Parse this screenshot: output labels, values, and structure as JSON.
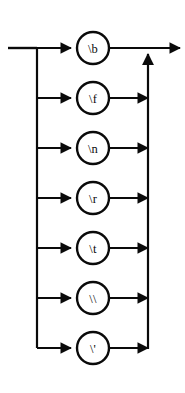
{
  "diagram": {
    "kind": "railroad-syntax-diagram",
    "orientation": "vertical-stack",
    "line_color": "#0a0a0a",
    "node_fill": "#ffffff",
    "background": "#ffffff",
    "geometry": {
      "width": 185,
      "height": 393,
      "entry_x": 8,
      "left_rail_x": 37,
      "node_center_x": 93,
      "right_rail_x": 148,
      "exit_x": 180,
      "main_line_y": 48,
      "row_spacing": 50,
      "node_radius": 16
    },
    "entry": {
      "label": "",
      "from_x": 8,
      "to_x": 37
    },
    "exit": {
      "label": "",
      "from_x": 148,
      "to_x": 180,
      "arrow": "right"
    },
    "return_rail": {
      "arrow": "up",
      "from_y": 348,
      "to_y": 48
    },
    "nodes": [
      {
        "id": "esc-backspace",
        "label": "\\b",
        "cy": 48,
        "row": 1
      },
      {
        "id": "esc-formfeed",
        "label": "\\f",
        "cy": 98,
        "row": 2
      },
      {
        "id": "esc-newline",
        "label": "\\n",
        "cy": 148,
        "row": 3
      },
      {
        "id": "esc-return",
        "label": "\\r",
        "cy": 198,
        "row": 4
      },
      {
        "id": "esc-tab",
        "label": "\\t",
        "cy": 248,
        "row": 5
      },
      {
        "id": "esc-backslash",
        "label": "\\\\",
        "cy": 298,
        "row": 6
      },
      {
        "id": "esc-quote",
        "label": "\\'",
        "cy": 348,
        "row": 7
      }
    ]
  }
}
